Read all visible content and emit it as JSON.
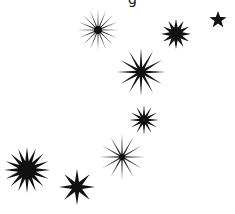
{
  "canvas": {
    "width": 235,
    "height": 214,
    "background": "#ffffff"
  },
  "top_fragment": {
    "text": "g",
    "color": "#111111"
  },
  "stars": [
    {
      "id": "sparkle-top",
      "cx": 98,
      "cy": 30,
      "points": 16,
      "outer": 21,
      "inner": 3,
      "core": 4,
      "color": "#111111",
      "style": "thin"
    },
    {
      "id": "star-top-right-medium",
      "cx": 176,
      "cy": 34,
      "points": 12,
      "outer": 15,
      "inner": 6.5,
      "core": 0,
      "color": "#111111",
      "style": "solid"
    },
    {
      "id": "star-corner-small",
      "cx": 218,
      "cy": 20,
      "points": 5,
      "outer": 9,
      "inner": 3.6,
      "core": 0,
      "color": "#111111",
      "style": "solid"
    },
    {
      "id": "star-middle-large",
      "cx": 141,
      "cy": 72,
      "points": 12,
      "outer": 24,
      "inner": 5,
      "core": 0,
      "color": "#111111",
      "style": "solid"
    },
    {
      "id": "star-middle-medium",
      "cx": 144,
      "cy": 120,
      "points": 12,
      "outer": 15,
      "inner": 4.5,
      "core": 0,
      "color": "#111111",
      "style": "solid"
    },
    {
      "id": "sparkle-lower",
      "cx": 122,
      "cy": 157,
      "points": 12,
      "outer": 23,
      "inner": 3,
      "core": 3,
      "color": "#111111",
      "style": "thin"
    },
    {
      "id": "star-bottom-left-large",
      "cx": 27,
      "cy": 170,
      "points": 16,
      "outer": 23,
      "inner": 9,
      "core": 0,
      "color": "#111111",
      "style": "solid"
    },
    {
      "id": "star-bottom-eight",
      "cx": 77,
      "cy": 187,
      "points": 8,
      "outer": 18,
      "inner": 5.5,
      "core": 0,
      "color": "#111111",
      "style": "solid"
    }
  ]
}
